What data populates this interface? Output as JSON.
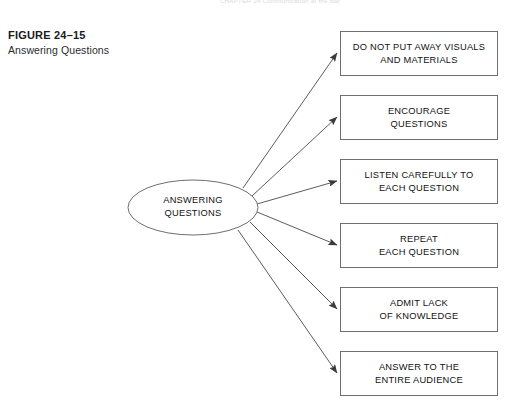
{
  "page": {
    "running_head": "CHAPTER 24    Communication at the Bar",
    "background_color": "#ffffff"
  },
  "figure": {
    "number": "FIGURE 24–15",
    "title": "Answering Questions"
  },
  "diagram": {
    "type": "radial-flow",
    "stroke_color": "#6e6e73",
    "arrow_color": "#4a4a4f",
    "fill_color": "#ffffff",
    "hub": {
      "shape": "ellipse",
      "label": "ANSWERING\nQUESTIONS",
      "cx": 193,
      "cy": 207.5,
      "rx": 65,
      "ry": 27.5
    },
    "nodes": [
      {
        "id": "node-1",
        "label": "DO NOT PUT AWAY VISUALS\nAND MATERIALS",
        "x": 340,
        "y": 31,
        "width": 158,
        "height": 45
      },
      {
        "id": "node-2",
        "label": "ENCOURAGE\nQUESTIONS",
        "x": 340,
        "y": 95,
        "width": 158,
        "height": 45
      },
      {
        "id": "node-3",
        "label": "LISTEN CAREFULLY TO\nEACH QUESTION",
        "x": 340,
        "y": 159,
        "width": 158,
        "height": 45
      },
      {
        "id": "node-4",
        "label": "REPEAT\nEACH QUESTION",
        "x": 340,
        "y": 223,
        "width": 158,
        "height": 45
      },
      {
        "id": "node-5",
        "label": "ADMIT LACK\nOF KNOWLEDGE",
        "x": 340,
        "y": 287,
        "width": 158,
        "height": 45
      },
      {
        "id": "node-6",
        "label": "ANSWER TO THE\nENTIRE AUDIENCE",
        "x": 340,
        "y": 351,
        "width": 158,
        "height": 45
      }
    ],
    "connectors": [
      {
        "id": "arrow-1",
        "from": "hub",
        "to": "node-1",
        "x1": 243,
        "y1": 188,
        "x2": 337,
        "y2": 53
      },
      {
        "id": "arrow-2",
        "from": "hub",
        "to": "node-2",
        "x1": 252,
        "y1": 196,
        "x2": 337,
        "y2": 117
      },
      {
        "id": "arrow-3",
        "from": "hub",
        "to": "node-3",
        "x1": 257,
        "y1": 204,
        "x2": 337,
        "y2": 181
      },
      {
        "id": "arrow-4",
        "from": "hub",
        "to": "node-4",
        "x1": 257,
        "y1": 212,
        "x2": 337,
        "y2": 245
      },
      {
        "id": "arrow-5",
        "from": "hub",
        "to": "node-5",
        "x1": 250,
        "y1": 222,
        "x2": 337,
        "y2": 309
      },
      {
        "id": "arrow-6",
        "from": "hub",
        "to": "node-6",
        "x1": 238,
        "y1": 230,
        "x2": 337,
        "y2": 373
      }
    ]
  }
}
